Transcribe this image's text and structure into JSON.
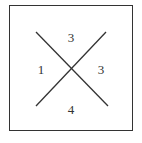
{
  "diagram": {
    "regions": {
      "top": "3",
      "left": "1",
      "right": "3",
      "bottom": "4"
    },
    "colors": {
      "line": "#333333",
      "background": "#ffffff"
    }
  }
}
